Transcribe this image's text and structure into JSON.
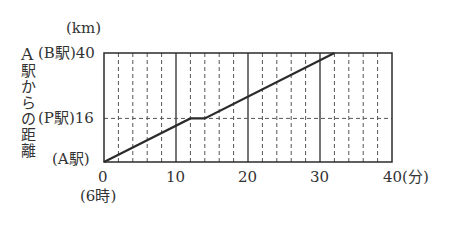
{
  "chart_data": {
    "type": "line",
    "title": "",
    "xlabel": "分",
    "ylabel": "A駅からの距離",
    "yunit": "(km)",
    "xlim": [
      0,
      40
    ],
    "ylim": [
      0,
      40
    ],
    "x_ticks": [
      0,
      10,
      20,
      30,
      40
    ],
    "x_tick_labels": [
      "0",
      "10",
      "20",
      "30",
      "40(分)"
    ],
    "x_origin_note": "(6時)",
    "y_ticks": [
      0,
      16,
      40
    ],
    "y_tick_labels": [
      {
        "value": 0,
        "station": "(A駅)",
        "number": ""
      },
      {
        "value": 16,
        "station": "(P駅)",
        "number": "16"
      },
      {
        "value": 40,
        "station": "(B駅)",
        "number": "40"
      }
    ],
    "grid": {
      "x_minor_dashed_every": 2,
      "x_major_solid_every": 10,
      "y_dashed_at": [
        16
      ]
    },
    "series": [
      {
        "name": "train",
        "x": [
          0,
          12,
          14,
          32
        ],
        "y": [
          0,
          16,
          16,
          40
        ]
      }
    ]
  },
  "labels": {
    "unit": "(km)",
    "ylabel_chars": [
      "A",
      "駅",
      "か",
      "ら",
      "の",
      "距",
      "離"
    ],
    "b_station": "(B駅)",
    "b_value": "40",
    "p_station": "(P駅)",
    "p_value": "16",
    "a_station": "(A駅)",
    "x0": "0",
    "x10": "10",
    "x20": "20",
    "x30": "30",
    "x40": "40(分)",
    "time_note": "(6時)"
  }
}
